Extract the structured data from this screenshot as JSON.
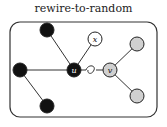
{
  "title": "rewire-to-random",
  "colors": {
    "black_node": "#111111",
    "white_node": "#ffffff",
    "gray_node": "#d0d0d0",
    "edge": "#333333",
    "frame": "#333333"
  },
  "nodes": [
    {
      "id": "a",
      "label": "",
      "fill": "black"
    },
    {
      "id": "b",
      "label": "",
      "fill": "black"
    },
    {
      "id": "c",
      "label": "",
      "fill": "black"
    },
    {
      "id": "u",
      "label": "u",
      "fill": "black"
    },
    {
      "id": "x",
      "label": "x",
      "fill": "white"
    },
    {
      "id": "v",
      "label": "v",
      "fill": "gray"
    },
    {
      "id": "d",
      "label": "",
      "fill": "gray"
    },
    {
      "id": "e",
      "label": "",
      "fill": "gray"
    }
  ],
  "edges": [
    [
      "a",
      "u"
    ],
    [
      "b",
      "u"
    ],
    [
      "b",
      "c"
    ],
    [
      "x",
      "u"
    ],
    [
      "v",
      "d"
    ],
    [
      "v",
      "e"
    ]
  ],
  "broken_edge": [
    "u",
    "v"
  ]
}
